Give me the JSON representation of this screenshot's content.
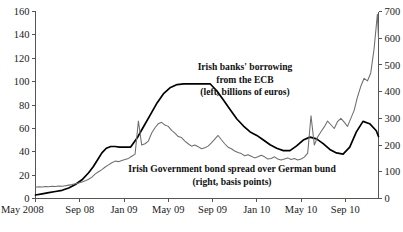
{
  "chart_data": {
    "type": "line",
    "title": "",
    "xlabel": "",
    "grid": false,
    "legend_position": "inline-annotations",
    "x_axis": {
      "tick_labels": [
        "May 2008",
        "Sep 08",
        "Jan 09",
        "May 09",
        "Sep 09",
        "Jan 10",
        "May 10",
        "Sep 10"
      ],
      "tick_months": [
        0,
        4,
        8,
        12,
        16,
        20,
        24,
        28
      ],
      "range_months": [
        0,
        31
      ]
    },
    "left_axis": {
      "label": "Irish banks' borrowing from the ECB (left, billions of euros)",
      "unit": "billions of euros",
      "ticks": [
        0,
        20,
        40,
        60,
        80,
        100,
        120,
        140,
        160
      ],
      "ylim": [
        0,
        160
      ]
    },
    "right_axis": {
      "label": "Irish Government bond spread over German bund (right, basis points)",
      "unit": "basis points",
      "ticks": [
        0,
        100,
        200,
        300,
        400,
        500,
        600,
        700
      ],
      "ylim": [
        0,
        700
      ]
    },
    "annotations": [
      {
        "name": "ecb-annotation",
        "lines": [
          "Irish banks' borrowing",
          "from the ECB",
          "(left, billions of euros)"
        ],
        "x": 245,
        "y": 70
      },
      {
        "name": "spread-annotation",
        "lines": [
          "Irish Government bond spread over German bund",
          "(right, basis points)"
        ],
        "x": 232,
        "y": 172
      }
    ],
    "series": [
      {
        "name": "Irish banks' borrowing from the ECB",
        "short_name": "ecb-borrowing",
        "axis": "left",
        "color": "#000000",
        "unit": "billions of euros",
        "x_months": [
          0,
          0.6,
          1.2,
          1.8,
          2.4,
          3.0,
          3.6,
          4.2,
          4.8,
          5.2,
          5.6,
          6.0,
          6.4,
          6.8,
          7.2,
          7.6,
          8.0,
          8.6,
          9.2,
          9.8,
          10.4,
          11.0,
          11.6,
          12.2,
          12.8,
          13.4,
          14.0,
          14.6,
          15.2,
          15.8,
          16.4,
          17.0,
          17.6,
          18.2,
          18.8,
          19.4,
          20.0,
          20.6,
          21.2,
          21.8,
          22.4,
          23.0,
          23.6,
          24.2,
          24.8,
          25.4,
          26.0,
          26.6,
          27.2,
          27.8,
          28.4,
          29.0,
          29.6,
          30.2,
          30.8,
          31.0
        ],
        "values": [
          3,
          4,
          5,
          6,
          7,
          9,
          12,
          16,
          22,
          27,
          33,
          39,
          43,
          44.5,
          44.5,
          44,
          44,
          44,
          52,
          62,
          72,
          82,
          90,
          95,
          97.5,
          98,
          98,
          98,
          98,
          98,
          92,
          84,
          76,
          68,
          62,
          57,
          54,
          50,
          46,
          43,
          41,
          41,
          45,
          50,
          52.5,
          51,
          47,
          42,
          39,
          38,
          44,
          57,
          66,
          64,
          58,
          53
        ]
      },
      {
        "name": "Irish Government bond spread over German bund",
        "short_name": "bond-spread",
        "axis": "right",
        "color": "#6e6e6e",
        "unit": "basis points",
        "x_months": [
          0,
          0.3,
          0.6,
          0.9,
          1.2,
          1.5,
          1.8,
          2.1,
          2.4,
          2.7,
          3.0,
          3.3,
          3.6,
          3.9,
          4.2,
          4.5,
          4.8,
          5.1,
          5.4,
          5.7,
          6.0,
          6.3,
          6.6,
          6.9,
          7.2,
          7.5,
          7.8,
          8.1,
          8.4,
          8.7,
          9.0,
          9.3,
          9.6,
          9.9,
          10.2,
          10.5,
          10.8,
          11.1,
          11.4,
          11.7,
          12.0,
          12.3,
          12.6,
          12.9,
          13.2,
          13.5,
          13.8,
          14.1,
          14.4,
          14.7,
          15.0,
          15.3,
          15.6,
          15.9,
          16.2,
          16.5,
          16.8,
          17.1,
          17.4,
          17.7,
          18.0,
          18.3,
          18.6,
          18.9,
          19.2,
          19.5,
          19.8,
          20.1,
          20.4,
          20.7,
          21.0,
          21.3,
          21.6,
          21.9,
          22.2,
          22.5,
          22.8,
          23.1,
          23.4,
          23.7,
          24.0,
          24.3,
          24.6,
          24.9,
          25.2,
          25.5,
          25.8,
          26.1,
          26.4,
          26.7,
          27.0,
          27.3,
          27.6,
          27.9,
          28.2,
          28.5,
          28.8,
          29.1,
          29.4,
          29.7,
          30.0,
          30.3,
          30.6,
          30.9,
          31.0
        ],
        "values": [
          42,
          44,
          43,
          45,
          44,
          46,
          45,
          47,
          46,
          48,
          50,
          52,
          55,
          58,
          62,
          66,
          72,
          80,
          92,
          100,
          108,
          118,
          126,
          134,
          140,
          138,
          142,
          146,
          150,
          158,
          166,
          290,
          200,
          205,
          215,
          245,
          265,
          280,
          285,
          275,
          270,
          255,
          245,
          232,
          228,
          215,
          205,
          196,
          200,
          194,
          186,
          190,
          196,
          208,
          222,
          236,
          220,
          205,
          192,
          186,
          178,
          172,
          168,
          160,
          164,
          158,
          152,
          156,
          162,
          156,
          148,
          150,
          156,
          148,
          144,
          148,
          152,
          146,
          150,
          144,
          148,
          155,
          170,
          310,
          200,
          230,
          250,
          268,
          290,
          276,
          262,
          288,
          300,
          286,
          270,
          300,
          330,
          380,
          420,
          450,
          440,
          470,
          560,
          690,
          600
        ]
      }
    ]
  },
  "axis_labels": {
    "left_ticks": [
      "0",
      "20",
      "40",
      "60",
      "80",
      "100",
      "120",
      "140",
      "160"
    ],
    "right_ticks": [
      "0",
      "100",
      "200",
      "300",
      "400",
      "500",
      "600",
      "700"
    ],
    "x_ticks": [
      "May 2008",
      "Sep 08",
      "Jan 09",
      "May 09",
      "Sep 09",
      "Jan 10",
      "May 10",
      "Sep 10"
    ]
  }
}
